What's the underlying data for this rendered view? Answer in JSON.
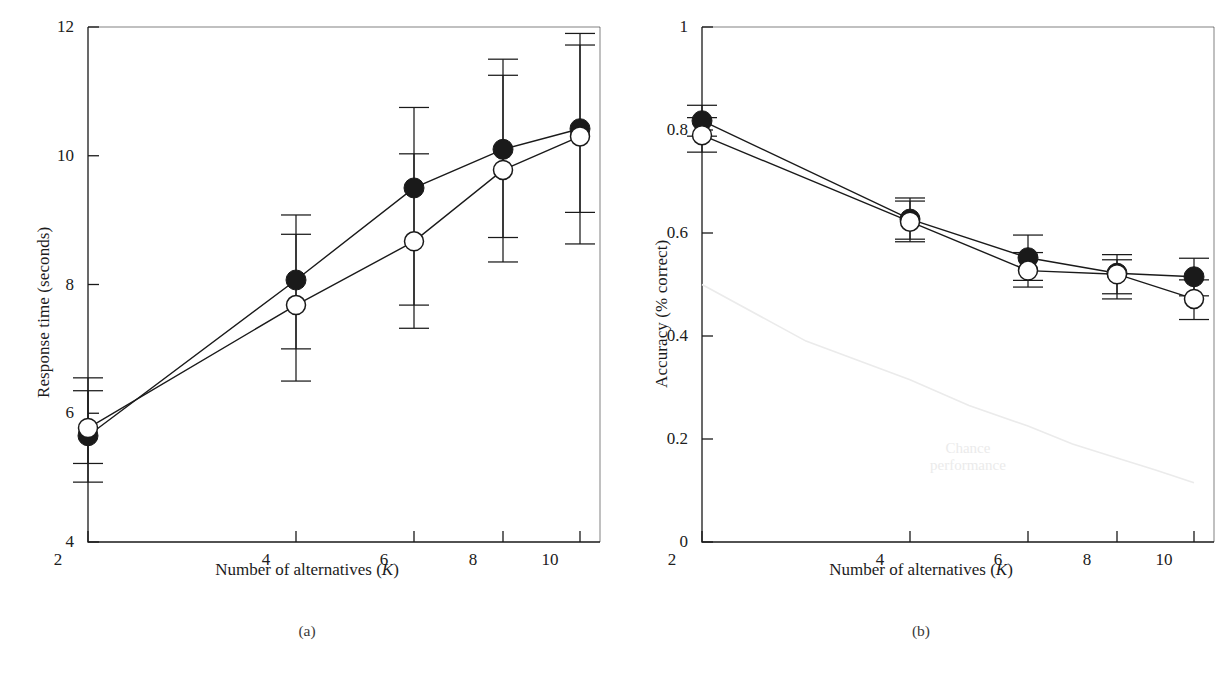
{
  "figure": {
    "background": "#ffffff",
    "ink_color": "#1a1a1a",
    "chance_color": "#ebebeb"
  },
  "panels": [
    {
      "id": "a",
      "caption": "(a)",
      "xlabel_prefix": "Number of alternatives (",
      "xlabel_var": "K",
      "xlabel_suffix": ")",
      "ylabel": "Response time (seconds)",
      "ytick_labels": [
        "12",
        "10",
        "8",
        "6",
        "4"
      ],
      "xtick_labels": [
        "2",
        "4",
        "6",
        "8",
        "10"
      ]
    },
    {
      "id": "b",
      "caption": "(b)",
      "xlabel_prefix": "Number of alternatives (",
      "xlabel_var": "K",
      "xlabel_suffix": ")",
      "ylabel": "Accuracy (% correct)",
      "ytick_labels": [
        "1",
        "0.8",
        "0.6",
        "0.4",
        "0.2",
        "0"
      ],
      "xtick_labels": [
        "2",
        "4",
        "6",
        "8",
        "10"
      ],
      "annotation_line1": "Chance",
      "annotation_line2": "performance"
    }
  ],
  "chart_data": [
    {
      "type": "line",
      "panel": "a",
      "title": "(a)",
      "xlabel": "Number of alternatives (K)",
      "ylabel": "Response time (seconds)",
      "x": [
        2,
        4,
        6,
        8,
        10
      ],
      "xtick_labels": [
        "2",
        "4",
        "6",
        "8",
        "10"
      ],
      "ytick_values": [
        4,
        6,
        8,
        10,
        12
      ],
      "ytick_labels": [
        "4",
        "6",
        "8",
        "10",
        "12"
      ],
      "ylim": [
        3.75,
        12.4
      ],
      "grid": false,
      "legend": "none",
      "error_bar_type": "asymmetric",
      "series": [
        {
          "name": "filled-circles",
          "marker": "filled-circle",
          "values": [
            5.65,
            8.07,
            9.5,
            10.1,
            10.42
          ],
          "err_low": [
            4.93,
            6.5,
            7.32,
            8.35,
            8.63
          ],
          "err_high": [
            6.35,
            8.78,
            10.03,
            11.25,
            11.72
          ]
        },
        {
          "name": "open-circles",
          "marker": "open-circle",
          "values": [
            5.77,
            7.68,
            8.67,
            9.78,
            10.3
          ],
          "err_low": [
            5.22,
            7.0,
            7.68,
            8.73,
            9.12
          ],
          "err_high": [
            6.55,
            9.08,
            10.75,
            11.5,
            11.9
          ]
        }
      ]
    },
    {
      "type": "line",
      "panel": "b",
      "title": "(b)",
      "xlabel": "Number of alternatives (K)",
      "ylabel": "Accuracy (% correct)",
      "x": [
        2,
        4,
        6,
        8,
        10
      ],
      "xtick_labels": [
        "2",
        "4",
        "6",
        "8",
        "10"
      ],
      "ytick_values": [
        0,
        0.2,
        0.4,
        0.6,
        0.8,
        1
      ],
      "ytick_labels": [
        "0",
        "0.2",
        "0.4",
        "0.6",
        "0.8",
        "1"
      ],
      "ylim": [
        -0.03,
        1.03
      ],
      "grid": false,
      "legend": "none",
      "error_bar_type": "asymmetric",
      "annotation": "Chance performance",
      "series": [
        {
          "name": "filled-circles",
          "marker": "filled-circle",
          "values": [
            0.818,
            0.627,
            0.552,
            0.522,
            0.515
          ],
          "err_low": [
            0.788,
            0.588,
            0.508,
            0.482,
            0.478
          ],
          "err_high": [
            0.848,
            0.668,
            0.596,
            0.558,
            0.551
          ]
        },
        {
          "name": "open-circles",
          "marker": "open-circle",
          "values": [
            0.79,
            0.622,
            0.527,
            0.52,
            0.472
          ],
          "err_low": [
            0.757,
            0.583,
            0.495,
            0.472,
            0.432
          ],
          "err_high": [
            0.824,
            0.662,
            0.562,
            0.548,
            0.509
          ]
        },
        {
          "name": "chance-performance",
          "marker": "none",
          "style": "faint-curve",
          "x": [
            2,
            3,
            4,
            5,
            6,
            7,
            8,
            9,
            10
          ],
          "values": [
            0.5,
            0.39,
            0.315,
            0.265,
            0.225,
            0.19,
            0.163,
            0.14,
            0.115
          ]
        }
      ]
    }
  ]
}
